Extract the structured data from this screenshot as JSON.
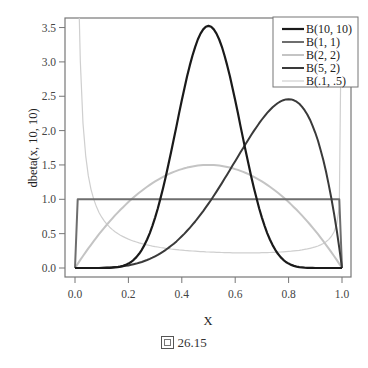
{
  "chart_data": {
    "type": "line",
    "title": "",
    "xlabel": "X",
    "ylabel": "dbeta(x, 10, 10)",
    "xlim": [
      -0.04,
      1.03
    ],
    "ylim": [
      -0.12,
      3.62
    ],
    "x_ticks": [
      0.0,
      0.2,
      0.4,
      0.6,
      0.8,
      1.0
    ],
    "x_tick_labels": [
      "0.0",
      "0.2",
      "0.4",
      "0.6",
      "0.8",
      "1.0"
    ],
    "y_ticks": [
      0.0,
      0.5,
      1.0,
      1.5,
      2.0,
      2.5,
      3.0,
      3.5
    ],
    "y_tick_labels": [
      "0.0",
      "0.5",
      "1.0",
      "1.5",
      "2.0",
      "2.5",
      "3.0",
      "3.5"
    ],
    "grid": false,
    "legend_position": "top-right",
    "series": [
      {
        "name": "B(10, 10)",
        "alpha": 10,
        "beta": 10,
        "color": "#1a1a1a",
        "width": 2.2,
        "peak": {
          "x": 0.5,
          "y": 3.52
        }
      },
      {
        "name": "B(1, 1)",
        "alpha": 1,
        "beta": 1,
        "color": "#6e6e6e",
        "width": 2.0,
        "peak": {
          "x": 0.5,
          "y": 1.0
        }
      },
      {
        "name": "B(2, 2)",
        "alpha": 2,
        "beta": 2,
        "color": "#c4c4c4",
        "width": 2.0,
        "peak": {
          "x": 0.5,
          "y": 1.5
        }
      },
      {
        "name": "B(5, 2)",
        "alpha": 5,
        "beta": 2,
        "color": "#3a3a3a",
        "width": 2.0,
        "peak": {
          "x": 0.8,
          "y": 2.46
        }
      },
      {
        "name": "B(.1, .5)",
        "alpha": 0.1,
        "beta": 0.5,
        "color": "#cfcfcf",
        "width": 1.2,
        "min": {
          "x": 0.5,
          "y": 0.22
        }
      }
    ]
  },
  "caption": {
    "icon": "figure-icon",
    "text": "26.15"
  }
}
